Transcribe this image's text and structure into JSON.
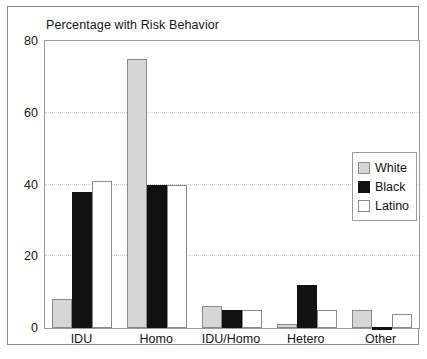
{
  "chart_data": {
    "type": "bar",
    "title": "Percentage with Risk Behavior",
    "xlabel": "",
    "ylabel": "",
    "ylim": [
      0,
      80
    ],
    "yticks": [
      0,
      20,
      40,
      60,
      80
    ],
    "ytick_labels": [
      "0",
      "20",
      "40",
      "60",
      "80"
    ],
    "grid": true,
    "legend_position": "right",
    "categories": [
      "IDU",
      "Homo",
      "IDU/Homo",
      "Hetero",
      "Other"
    ],
    "series": [
      {
        "name": "White",
        "color": "#d6d6d6",
        "values": [
          8,
          75,
          6,
          1,
          5
        ]
      },
      {
        "name": "Black",
        "color": "#111111",
        "values": [
          38,
          40,
          5,
          12,
          0
        ]
      },
      {
        "name": "Latino",
        "color": "#ffffff",
        "values": [
          41,
          40,
          5,
          5,
          4
        ]
      }
    ]
  },
  "legend": {
    "entries": [
      {
        "label": "White"
      },
      {
        "label": "Black"
      },
      {
        "label": "Latino"
      }
    ]
  }
}
